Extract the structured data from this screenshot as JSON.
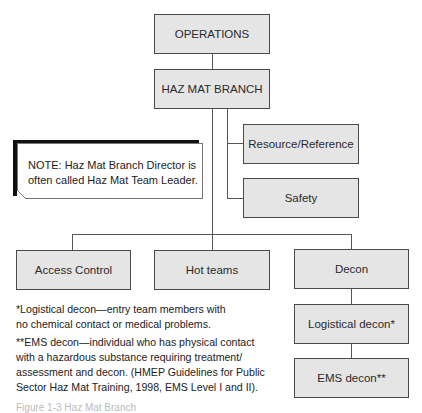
{
  "chart": {
    "title_node": "OPERATIONS",
    "branch_node": "HAZ MAT BRANCH",
    "staff_nodes": [
      "Resource/Reference",
      "Safety"
    ],
    "groups": [
      "Access Control",
      "Hot teams",
      "Decon"
    ],
    "decon_subnodes": [
      "Logistical decon*",
      "EMS decon**"
    ]
  },
  "note": {
    "line1": "NOTE: Haz Mat Branch Director is",
    "line2": "often called Haz Mat Team Leader."
  },
  "footnotes": {
    "logistical": {
      "line1": "*Logistical decon—entry team members with",
      "line2": "no chemical contact or medical problems."
    },
    "ems": {
      "line1": "**EMS decon—individual who has physical contact",
      "line2": "with a hazardous substance requiring treatment/",
      "line3": "assessment and decon. (HMEP Guidelines for Public",
      "line4": "Sector Haz Mat Training, 1998, EMS Level I and II)."
    }
  },
  "caption": {
    "text": "Figure 1-3  Haz Mat Branch"
  },
  "colors": {
    "box_fill": "#e5e5e5",
    "box_border": "#4a4a4a",
    "line": "#555555"
  }
}
